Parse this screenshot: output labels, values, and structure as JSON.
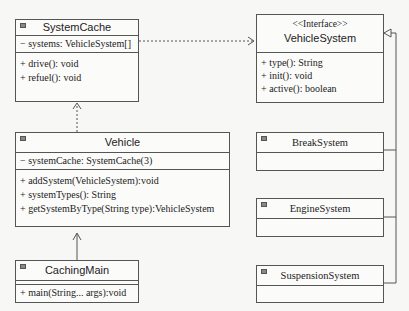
{
  "classes": {
    "system_cache": {
      "name": "SystemCache",
      "attributes": [
        "− systems: VehicleSystem[]"
      ],
      "methods": [
        "+ drive(): void",
        "+ refuel(): void"
      ]
    },
    "vehicle_system": {
      "stereotype": "<<Interface>>",
      "name": "VehicleSystem",
      "methods": [
        "+ type(): String",
        "+ init(): void",
        "+ active(): boolean"
      ]
    },
    "vehicle": {
      "name": "Vehicle",
      "attributes": [
        "− systemCache: SystemCache(3)"
      ],
      "methods": [
        "+ addSystem(VehicleSystem):void",
        "+ systemTypes(): String",
        "+ getSystemByType(String type):VehicleSystem"
      ]
    },
    "caching_main": {
      "name": "CachingMain",
      "methods": [
        "+ main(String... args):void"
      ]
    },
    "break_system": {
      "name": "BreakSystem"
    },
    "engine_system": {
      "name": "EngineSystem"
    },
    "suspension_system": {
      "name": "SuspensionSystem"
    }
  },
  "relations": [
    {
      "from": "SystemCache",
      "to": "VehicleSystem",
      "type": "dependency"
    },
    {
      "from": "Vehicle",
      "to": "SystemCache",
      "type": "dependency"
    },
    {
      "from": "CachingMain",
      "to": "Vehicle",
      "type": "association"
    },
    {
      "from": "BreakSystem",
      "to": "VehicleSystem",
      "type": "realization"
    },
    {
      "from": "EngineSystem",
      "to": "VehicleSystem",
      "type": "realization"
    },
    {
      "from": "SuspensionSystem",
      "to": "VehicleSystem",
      "type": "realization"
    }
  ]
}
